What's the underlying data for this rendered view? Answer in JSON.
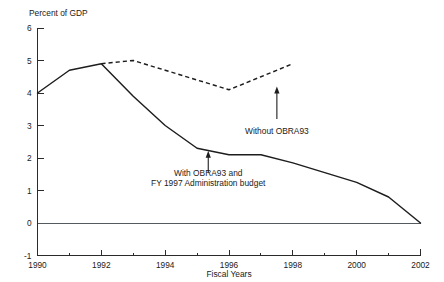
{
  "chart_data": {
    "type": "line",
    "title": "",
    "subtitle": "",
    "xlabel": "Fiscal Years",
    "ylabel": "Percent of GDP",
    "grid": false,
    "legend_position": "inline-annotations",
    "xlim": [
      1990,
      2002
    ],
    "ylim": [
      -1,
      6
    ],
    "x_ticks": [
      1990,
      1992,
      1994,
      1996,
      1998,
      2000,
      2002
    ],
    "x_tick_labels": [
      "1990",
      "1992",
      "1994",
      "1996",
      "1998",
      "2000",
      "2002"
    ],
    "x_minor_ticks": [
      1991,
      1993,
      1995,
      1997,
      1999,
      2001
    ],
    "y_ticks": [
      -1,
      0,
      1,
      2,
      3,
      4,
      5,
      6
    ],
    "y_tick_labels": [
      "-1",
      "0",
      "1",
      "2",
      "3",
      "4",
      "5",
      "6"
    ],
    "zero_line": 0,
    "series": [
      {
        "name": "With OBRA93 and FY 1997 Administration budget",
        "style": "solid",
        "x": [
          1990,
          1991,
          1992,
          1993,
          1994,
          1995,
          1996,
          1997,
          1998,
          1999,
          2000,
          2001,
          2002
        ],
        "values": [
          4.0,
          4.7,
          4.9,
          3.9,
          3.0,
          2.3,
          2.1,
          2.1,
          1.85,
          1.55,
          1.25,
          0.8,
          0.0
        ]
      },
      {
        "name": "Without OBRA93",
        "style": "dashed",
        "x": [
          1992,
          1993,
          1994,
          1995,
          1996,
          1997,
          1998
        ],
        "values": [
          4.9,
          5.0,
          4.7,
          4.4,
          4.1,
          4.5,
          4.9
        ]
      }
    ],
    "annotations": [
      {
        "id": "without-obra93",
        "lines": [
          "Without OBRA93"
        ],
        "text_x": 1997.5,
        "text_y": 2.75,
        "arrow_from_x": 1997.5,
        "arrow_from_y": 3.2,
        "arrow_to_x": 1997.5,
        "arrow_to_y": 4.2
      },
      {
        "id": "with-obra93",
        "lines": [
          "With OBRA93 and",
          "FY 1997 Administration budget"
        ],
        "text_x": 1995.35,
        "text_y": 1.45,
        "arrow_from_x": 1995.35,
        "arrow_from_y": 1.55,
        "arrow_to_x": 1995.35,
        "arrow_to_y": 2.22
      }
    ],
    "colors": {
      "line": "#1d1d1d",
      "axis": "#2b2b2b",
      "zero_line": "#555a5e",
      "background": "#ffffff"
    }
  }
}
